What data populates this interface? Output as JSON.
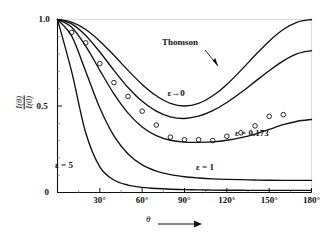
{
  "figure": {
    "name": "compton-scattering-angular-distribution",
    "background": "#ffffff",
    "ink": "#111111"
  },
  "axes": {
    "x": {
      "label": "θ",
      "label_arrow": "→",
      "min_deg": 0,
      "max_deg": 180,
      "ticks": [
        0,
        30,
        60,
        90,
        120,
        150,
        180
      ],
      "tick_labels": [
        "",
        "30°",
        "60°",
        "90°",
        "120°",
        "150°",
        "180°"
      ],
      "minor_tick_step": 15
    },
    "y": {
      "label_numerator": "I(θ)",
      "label_denominator": "I(0)",
      "min": 0,
      "max": 1.0,
      "ticks": [
        0,
        0.5,
        1.0
      ],
      "tick_labels": [
        "0",
        "0.5",
        "1.0"
      ],
      "minor_tick_step": 0.1
    }
  },
  "annotations": [
    {
      "id": "thomson",
      "text": "Thomson",
      "x_px": 180,
      "y_px": 42,
      "arrow": true
    },
    {
      "id": "eps-zero",
      "text": "ε→0",
      "x_px": 176,
      "y_px": 93,
      "arrow": false
    },
    {
      "id": "eps-0173",
      "text": "ε = 0.173",
      "x_px": 252,
      "y_px": 133,
      "arrow": false
    },
    {
      "id": "eps-1",
      "text": "ε = 1",
      "x_px": 205,
      "y_px": 167,
      "arrow": false
    },
    {
      "id": "eps-5",
      "text": "ε = 5",
      "x_px": 64,
      "y_px": 165,
      "arrow": false
    }
  ],
  "chart_data": {
    "type": "line",
    "title": "",
    "xlabel": "θ",
    "ylabel": "I(θ)/I(0)",
    "xlim": [
      0,
      180
    ],
    "ylim": [
      0,
      1.0
    ],
    "xtick_labels": [
      "30°",
      "60°",
      "90°",
      "120°",
      "150°",
      "180°"
    ],
    "ytick_labels": [
      "0",
      "0.5",
      "1.0"
    ],
    "grid": false,
    "legend": "inline-curve-labels",
    "x": [
      0,
      10,
      20,
      30,
      40,
      50,
      60,
      70,
      80,
      90,
      100,
      110,
      120,
      130,
      140,
      150,
      160,
      170,
      180
    ],
    "series": [
      {
        "name": "Thomson",
        "label": "Thomson",
        "epsilon": 0,
        "style": "solid",
        "values": [
          1.0,
          0.985,
          0.942,
          0.875,
          0.793,
          0.706,
          0.625,
          0.559,
          0.515,
          0.5,
          0.515,
          0.559,
          0.625,
          0.706,
          0.793,
          0.875,
          0.942,
          0.985,
          1.0
        ]
      },
      {
        "name": "epsilon-to-zero",
        "label": "ε→0",
        "epsilon": 0.001,
        "style": "solid",
        "values": [
          1.0,
          0.975,
          0.908,
          0.812,
          0.706,
          0.607,
          0.527,
          0.47,
          0.437,
          0.428,
          0.441,
          0.473,
          0.52,
          0.578,
          0.641,
          0.704,
          0.761,
          0.803,
          0.82
        ]
      },
      {
        "name": "epsilon-0.173",
        "label": "ε = 0.173",
        "epsilon": 0.173,
        "style": "solid",
        "values": [
          1.0,
          0.955,
          0.846,
          0.706,
          0.57,
          0.459,
          0.379,
          0.329,
          0.302,
          0.291,
          0.29,
          0.293,
          0.302,
          0.317,
          0.338,
          0.365,
          0.392,
          0.412,
          0.422
        ]
      },
      {
        "name": "epsilon-1",
        "label": "ε = 1",
        "epsilon": 1,
        "style": "solid",
        "values": [
          1.0,
          0.905,
          0.7,
          0.488,
          0.327,
          0.223,
          0.16,
          0.124,
          0.103,
          0.091,
          0.084,
          0.079,
          0.076,
          0.074,
          0.072,
          0.071,
          0.07,
          0.07,
          0.07
        ]
      },
      {
        "name": "epsilon-5",
        "label": "ε = 5",
        "epsilon": 5,
        "style": "solid",
        "values": [
          1.0,
          0.7,
          0.345,
          0.148,
          0.072,
          0.043,
          0.03,
          0.023,
          0.019,
          0.017,
          0.015,
          0.014,
          0.013,
          0.013,
          0.012,
          0.012,
          0.012,
          0.012,
          0.012
        ]
      }
    ],
    "scatter": {
      "name": "experimental-points",
      "marker": "open-circle",
      "x": [
        10,
        20,
        30,
        40,
        50,
        60,
        70,
        80,
        90,
        100,
        110,
        120,
        130,
        140,
        150,
        160
      ],
      "y": [
        0.925,
        0.865,
        0.745,
        0.635,
        0.555,
        0.47,
        0.39,
        0.32,
        0.305,
        0.305,
        0.3,
        0.325,
        0.345,
        0.385,
        0.44,
        0.45
      ]
    }
  }
}
